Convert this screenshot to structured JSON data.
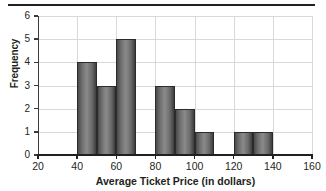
{
  "chart_data": {
    "type": "bar",
    "title": "",
    "xlabel": "Average Ticket Price (in dollars)",
    "ylabel": "Frequency",
    "xlim": [
      20,
      160
    ],
    "ylim": [
      0,
      6
    ],
    "grid": true,
    "legend": null,
    "bin_width": 10,
    "xticks": [
      20,
      40,
      60,
      80,
      100,
      120,
      140,
      160
    ],
    "yticks": [
      0,
      1,
      2,
      3,
      4,
      5,
      6
    ],
    "bins": [
      {
        "start": 40,
        "end": 50,
        "value": 4
      },
      {
        "start": 50,
        "end": 60,
        "value": 3
      },
      {
        "start": 60,
        "end": 70,
        "value": 5
      },
      {
        "start": 80,
        "end": 90,
        "value": 3
      },
      {
        "start": 90,
        "end": 100,
        "value": 2
      },
      {
        "start": 100,
        "end": 110,
        "value": 1
      },
      {
        "start": 120,
        "end": 130,
        "value": 1
      },
      {
        "start": 130,
        "end": 140,
        "value": 1
      }
    ],
    "categories": [
      "40-50",
      "50-60",
      "60-70",
      "70-80",
      "80-90",
      "90-100",
      "100-110",
      "110-120",
      "120-130",
      "130-140"
    ],
    "values": [
      4,
      3,
      5,
      0,
      3,
      2,
      1,
      0,
      1,
      1
    ],
    "bar_color": "#6e6e6e",
    "bar_edge_color": "#2b2b2b",
    "grid_color": "#d9d9d9",
    "axis_color": "#231f20"
  }
}
